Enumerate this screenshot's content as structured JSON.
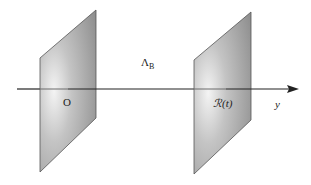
{
  "diagram": {
    "axis_label": "y",
    "origin_label": "O",
    "boundary_label": "ℛ(t)",
    "region_label_main": "Λ",
    "region_label_sub": "B",
    "colors": {
      "background": "#ffffff",
      "plane_fill_light": "#f2f2f2",
      "plane_fill_dark": "#8a8a8a",
      "plane_edge": "#555555",
      "axis": "#222222"
    }
  }
}
